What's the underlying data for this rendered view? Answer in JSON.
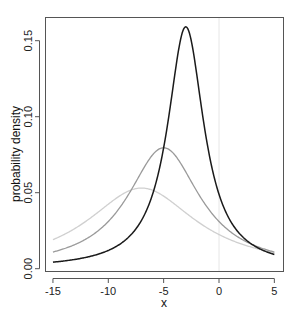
{
  "chart_data": {
    "type": "line",
    "title": "",
    "xlabel": "x",
    "ylabel": "probability density",
    "xlim": [
      -15,
      5
    ],
    "ylim": [
      0,
      0.16
    ],
    "x_ticks": [
      -15,
      -10,
      -5,
      0,
      5
    ],
    "x_tick_labels": [
      "-15",
      "-10",
      "-5",
      "0",
      "5"
    ],
    "y_ticks": [
      0.0,
      0.05,
      0.1,
      0.15
    ],
    "y_tick_labels": [
      "0.00",
      "0.05",
      "0.10",
      "0.15"
    ],
    "grid": false,
    "legend": null,
    "reference_lines": [
      {
        "type": "vertical",
        "x": 0,
        "color": "#e6e6e6"
      }
    ],
    "series": [
      {
        "name": "Cauchy(location=-7, scale=6)",
        "distribution": "cauchy",
        "location": -7,
        "scale": 6,
        "color": "#d0d0d0",
        "peak": {
          "x": -7,
          "y": 0.053
        },
        "x": [
          -15,
          -12.5,
          -10,
          -7,
          -5,
          -2.5,
          0,
          2.5,
          5
        ],
        "values": [
          0.0191,
          0.0288,
          0.0424,
          0.0531,
          0.0478,
          0.0339,
          0.0224,
          0.0151,
          0.0106
        ]
      },
      {
        "name": "Cauchy(location=-5, scale=4)",
        "distribution": "cauchy",
        "location": -5,
        "scale": 4,
        "color": "#9a9a9a",
        "peak": {
          "x": -5,
          "y": 0.0796
        },
        "x": [
          -15,
          -12.5,
          -10,
          -7,
          -5,
          -2.5,
          0,
          2.5,
          5
        ],
        "values": [
          0.011,
          0.0175,
          0.031,
          0.0637,
          0.0796,
          0.0573,
          0.031,
          0.0175,
          0.011
        ]
      },
      {
        "name": "Cauchy(location=-3, scale=2)",
        "distribution": "cauchy",
        "location": -3,
        "scale": 2,
        "color": "#1a1a1a",
        "peak": {
          "x": -3,
          "y": 0.159
        },
        "x": [
          -15,
          -12.5,
          -10,
          -7,
          -5,
          -3,
          -2.5,
          0,
          2.5,
          5
        ],
        "values": [
          0.0043,
          0.0068,
          0.012,
          0.0318,
          0.0796,
          0.1592,
          0.1498,
          0.049,
          0.0186,
          0.0094
        ]
      }
    ]
  }
}
